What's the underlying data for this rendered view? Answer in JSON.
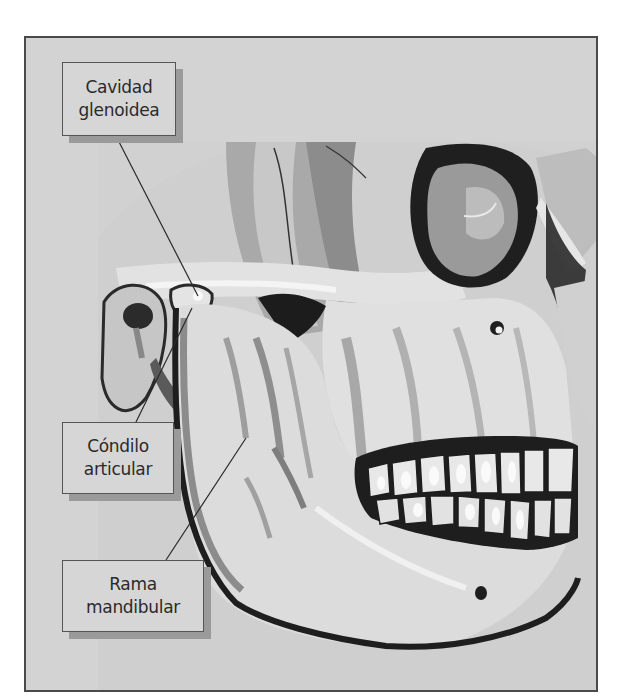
{
  "figure": {
    "labels": [
      {
        "id": "glenoid",
        "lines": [
          "Cavidad",
          "glenoidea"
        ]
      },
      {
        "id": "condyle",
        "lines": [
          "Cóndilo",
          "articular"
        ]
      },
      {
        "id": "ramus",
        "lines": [
          "Rama",
          "mandibular"
        ]
      }
    ]
  },
  "colors": {
    "background": "#d3d3d3",
    "frame_border": "#4a4a4a",
    "bone_light": "#e6e6e6",
    "bone_mid": "#b4b4b4",
    "bone_dark": "#7a7a7a",
    "shadow": "#1e1e1e",
    "tooth_highlight": "#f7f7f7"
  }
}
